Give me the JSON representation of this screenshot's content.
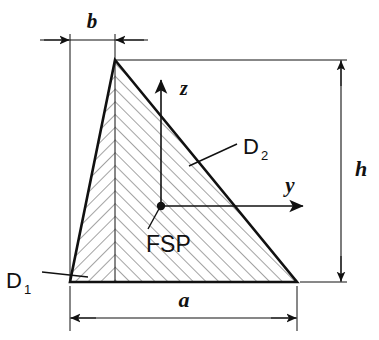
{
  "figure": {
    "background_color": "#ffffff",
    "line_color": "#111111",
    "hatch_color": "#555555",
    "labels": {
      "b": "b",
      "a": "a",
      "h": "h",
      "z": "z",
      "y": "y",
      "fsp": "FSP",
      "d1_base": "D",
      "d1_sub": "1",
      "d2_base": "D",
      "d2_sub": "2"
    },
    "dimensions": [
      {
        "name": "b",
        "label": "b",
        "orientation": "horizontal",
        "description": "distance from left vertex to apex"
      },
      {
        "name": "a",
        "label": "a",
        "orientation": "horizontal",
        "description": "base width of the triangle"
      },
      {
        "name": "h",
        "label": "h",
        "orientation": "vertical",
        "description": "height of the triangle"
      }
    ],
    "axes": [
      {
        "name": "z",
        "label": "z",
        "direction": "up"
      },
      {
        "name": "y",
        "label": "y",
        "direction": "right"
      }
    ],
    "points": [
      {
        "name": "FSP",
        "label": "FSP",
        "description": "centroid / area centre point"
      }
    ],
    "edges": [
      {
        "name": "D1",
        "label": "D",
        "subscript": "1",
        "description": "left inclined edge"
      },
      {
        "name": "D2",
        "label": "D",
        "subscript": "2",
        "description": "right inclined edge"
      }
    ]
  }
}
